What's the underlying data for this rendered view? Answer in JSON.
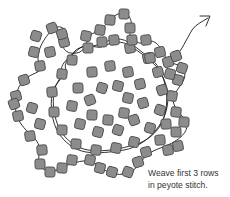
{
  "diagram": {
    "caption_line1": "Weave first 3 rows",
    "caption_line2": "in peyote stitch.",
    "colors": {
      "bead_fill": "#8c8c8c",
      "bead_stroke": "#4a4a4a",
      "thread": "#1a1a1a",
      "background": "#ffffff"
    },
    "arrow": {
      "direction": "up-right",
      "label": "thread-exit-arrow"
    },
    "beads": [
      [
        90,
        100
      ],
      [
        102,
        88
      ],
      [
        118,
        86
      ],
      [
        128,
        98
      ],
      [
        124,
        113
      ],
      [
        108,
        120
      ],
      [
        92,
        115
      ],
      [
        78,
        88
      ],
      [
        92,
        72
      ],
      [
        110,
        66
      ],
      [
        128,
        72
      ],
      [
        140,
        84
      ],
      [
        143,
        103
      ],
      [
        134,
        120
      ],
      [
        118,
        130
      ],
      [
        98,
        132
      ],
      [
        80,
        124
      ],
      [
        72,
        106
      ],
      [
        62,
        74
      ],
      [
        72,
        60
      ],
      [
        88,
        48
      ],
      [
        102,
        42
      ],
      [
        114,
        40
      ],
      [
        130,
        48
      ],
      [
        148,
        58
      ],
      [
        158,
        72
      ],
      [
        162,
        90
      ],
      [
        160,
        110
      ],
      [
        150,
        128
      ],
      [
        134,
        142
      ],
      [
        116,
        148
      ],
      [
        96,
        150
      ],
      [
        76,
        144
      ],
      [
        62,
        130
      ],
      [
        54,
        112
      ],
      [
        52,
        92
      ],
      [
        40,
        66
      ],
      [
        50,
        52
      ],
      [
        64,
        42
      ],
      [
        62,
        34
      ],
      [
        52,
        28
      ],
      [
        36,
        36
      ],
      [
        34,
        52
      ],
      [
        86,
        36
      ],
      [
        100,
        30
      ],
      [
        110,
        20
      ],
      [
        124,
        14
      ],
      [
        130,
        28
      ],
      [
        132,
        40
      ],
      [
        146,
        40
      ],
      [
        150,
        58
      ],
      [
        160,
        52
      ],
      [
        168,
        62
      ],
      [
        176,
        56
      ],
      [
        182,
        68
      ],
      [
        178,
        80
      ],
      [
        170,
        74
      ],
      [
        172,
        96
      ],
      [
        176,
        112
      ],
      [
        184,
        122
      ],
      [
        176,
        132
      ],
      [
        166,
        124
      ],
      [
        160,
        140
      ],
      [
        168,
        150
      ],
      [
        178,
        146
      ],
      [
        146,
        152
      ],
      [
        138,
        162
      ],
      [
        128,
        172
      ],
      [
        112,
        172
      ],
      [
        100,
        168
      ],
      [
        90,
        160
      ],
      [
        72,
        160
      ],
      [
        62,
        168
      ],
      [
        50,
        172
      ],
      [
        40,
        164
      ],
      [
        42,
        150
      ],
      [
        30,
        136
      ],
      [
        18,
        116
      ],
      [
        16,
        96
      ],
      [
        24,
        80
      ],
      [
        14,
        104
      ],
      [
        32,
        108
      ],
      [
        40,
        124
      ]
    ]
  }
}
